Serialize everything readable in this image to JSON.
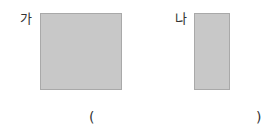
{
  "shapes": [
    {
      "label": "가",
      "type": "rectangle",
      "fill": "#c8c8c8"
    },
    {
      "label": "나",
      "type": "rectangle",
      "fill": "#c8c8c8"
    }
  ],
  "answer": {
    "open": "(",
    "close": ")",
    "value": ""
  }
}
